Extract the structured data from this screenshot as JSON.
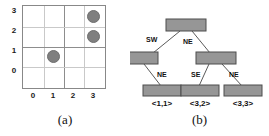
{
  "figure": {
    "panels": [
      {
        "id": "a",
        "caption": "(a)"
      },
      {
        "id": "b",
        "caption": "(b)"
      }
    ]
  },
  "colors": {
    "point_fill": "#7f7f7f",
    "point_stroke": "#6e6e6e",
    "node_fill": "#969696",
    "node_stroke": "#4d4d4d",
    "edge_stroke": "#5a5a5a",
    "grid_minor": "#c9c9c9",
    "grid_major": "#8d8d8d",
    "text": "#111111",
    "background": "#ffffff"
  },
  "grid": {
    "x_ticks": [
      "0",
      "1",
      "2",
      "3"
    ],
    "y_ticks": [
      "3",
      "2",
      "1",
      "0"
    ],
    "x_range": [
      0,
      4
    ],
    "y_range": [
      0,
      4
    ],
    "columns": 4,
    "rows": 4,
    "quadrant_split_x": 2,
    "quadrant_split_y": 2,
    "points": [
      {
        "label": "<3,3>",
        "x": 3,
        "y": 3
      },
      {
        "label": "<3,2>",
        "x": 3,
        "y": 2
      },
      {
        "label": "<1,1>",
        "x": 1,
        "y": 1
      }
    ]
  },
  "tree": {
    "nodes": [
      {
        "id": "root",
        "label": "",
        "cx": 56,
        "cy": 25
      },
      {
        "id": "sw",
        "label": "",
        "cx": 8,
        "cy": 58
      },
      {
        "id": "ne",
        "label": "",
        "cx": 86,
        "cy": 58
      },
      {
        "id": "leaf1",
        "label": "<1,1>",
        "cx": 32,
        "cy": 91
      },
      {
        "id": "leaf2",
        "label": "<3,2>",
        "cx": 70,
        "cy": 91
      },
      {
        "id": "leaf3",
        "label": "<3,3>",
        "cx": 113,
        "cy": 91
      }
    ],
    "edges": [
      {
        "from": "root",
        "to": "sw",
        "label": "SW",
        "lx": 16,
        "ly": 42
      },
      {
        "from": "root",
        "to": "ne",
        "label": "NE",
        "lx": 53,
        "ly": 44
      },
      {
        "from": "sw",
        "to": "leaf1",
        "label": "NE",
        "lx": 27,
        "ly": 77
      },
      {
        "from": "ne",
        "to": "leaf2",
        "label": "SE",
        "lx": 61,
        "ly": 77
      },
      {
        "from": "ne",
        "to": "leaf3",
        "label": "NE",
        "lx": 99,
        "ly": 77
      }
    ]
  }
}
